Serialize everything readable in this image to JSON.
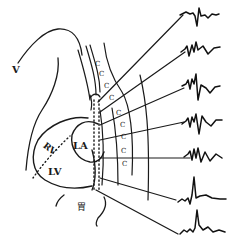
{
  "diagram": {
    "type": "anatomical-schematic",
    "labels": {
      "v": "V",
      "rv": "RV",
      "la": "LA",
      "lv": "LV",
      "stomach": "胃"
    },
    "vertebra_marks": [
      "C",
      "C",
      "C",
      "C",
      "C",
      "C",
      "C",
      "C",
      "C"
    ],
    "colors": {
      "ink": "#1a1a1a",
      "background": "#ffffff"
    },
    "leads": [
      {
        "index": 1,
        "line_from": [
          118,
          90
        ],
        "line_to": [
          183,
          15
        ],
        "waveform_y": 15,
        "pattern": "deep-negative QS with small r, inverted-ish T"
      },
      {
        "index": 2,
        "line_from": [
          118,
          96
        ],
        "line_to": [
          185,
          50
        ],
        "waveform_y": 50,
        "pattern": "rS with notched complex"
      },
      {
        "index": 3,
        "line_from": [
          118,
          104
        ],
        "line_to": [
          185,
          83
        ],
        "waveform_y": 83,
        "pattern": "polyphasic with deep S"
      },
      {
        "index": 4,
        "line_from": [
          118,
          118
        ],
        "line_to": [
          186,
          121
        ],
        "waveform_y": 121,
        "pattern": "polyphasic, deep S"
      },
      {
        "index": 5,
        "line_from": [
          118,
          157
        ],
        "line_to": [
          184,
          157
        ],
        "waveform_y": 157,
        "pattern": "notched rS"
      },
      {
        "index": 6,
        "line_from": [
          114,
          186
        ],
        "line_to": [
          178,
          204
        ],
        "waveform_y": 198,
        "pattern": "upright R, positive"
      },
      {
        "index": 7,
        "line_from": [
          108,
          210
        ],
        "line_to": [
          178,
          232
        ],
        "waveform_y": 230,
        "pattern": "tall upright R, positive"
      }
    ]
  }
}
